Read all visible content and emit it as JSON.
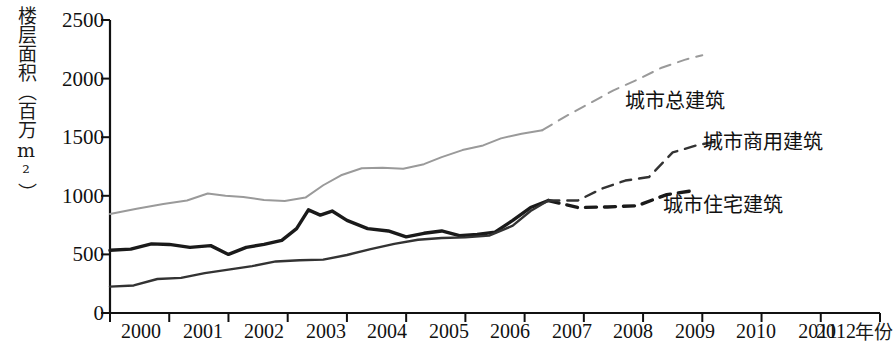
{
  "chart_data": {
    "type": "line",
    "title": "",
    "xlabel": "年份",
    "ylabel": "楼层面积（百万m²）",
    "xlim": [
      2000,
      2013
    ],
    "ylim": [
      0,
      2500
    ],
    "yticks": [
      0,
      500,
      1000,
      1500,
      2000,
      2500
    ],
    "xticks": [
      2000,
      2001,
      2002,
      2003,
      2004,
      2005,
      2006,
      2007,
      2008,
      2009,
      2010,
      2011,
      2012
    ],
    "grid": false,
    "legend_position": "inline-right",
    "series": [
      {
        "name": "城市总建筑",
        "color": "#9a9a9a",
        "width": 2.0,
        "solid_x": [
          2000.0,
          2000.45,
          2000.9,
          2001.3,
          2001.65,
          2001.95,
          2002.25,
          2002.6,
          2002.95,
          2003.3,
          2003.6,
          2003.9,
          2004.25,
          2004.6,
          2004.95,
          2005.3,
          2005.6,
          2005.95,
          2006.3,
          2006.6,
          2006.95,
          2007.3
        ],
        "solid_y": [
          845,
          890,
          930,
          960,
          1020,
          1000,
          990,
          965,
          955,
          985,
          1090,
          1175,
          1235,
          1240,
          1230,
          1270,
          1330,
          1390,
          1430,
          1490,
          1530,
          1560
        ],
        "dashed_x": [
          2007.3,
          2007.7,
          2008.1,
          2008.5,
          2008.9,
          2009.3,
          2009.7,
          2010.0
        ],
        "dashed_y": [
          1560,
          1680,
          1790,
          1900,
          1990,
          2090,
          2160,
          2200
        ]
      },
      {
        "name": "城市住宅建筑",
        "color": "#1a1a1a",
        "width": 3.4,
        "solid_x": [
          2000.0,
          2000.35,
          2000.7,
          2001.0,
          2001.35,
          2001.7,
          2002.0,
          2002.3,
          2002.6,
          2002.9,
          2003.15,
          2003.35,
          2003.55,
          2003.75,
          2004.0,
          2004.35,
          2004.7,
          2005.0,
          2005.3,
          2005.6,
          2005.9,
          2006.2,
          2006.5,
          2006.8,
          2007.1,
          2007.4
        ],
        "solid_y": [
          535,
          545,
          590,
          585,
          560,
          575,
          500,
          560,
          585,
          620,
          720,
          880,
          835,
          870,
          790,
          720,
          700,
          650,
          680,
          700,
          660,
          670,
          690,
          790,
          900,
          960
        ],
        "dashed_x": [
          2007.4,
          2007.9,
          2008.4,
          2008.9,
          2009.4,
          2009.8
        ],
        "dashed_y": [
          960,
          900,
          905,
          915,
          1010,
          1040
        ]
      },
      {
        "name": "城市商用建筑",
        "color": "#333333",
        "width": 2.4,
        "solid_x": [
          2000.0,
          2000.4,
          2000.8,
          2001.2,
          2001.6,
          2002.0,
          2002.4,
          2002.8,
          2003.2,
          2003.6,
          2004.0,
          2004.4,
          2004.8,
          2005.2,
          2005.6,
          2006.0,
          2006.4,
          2006.8,
          2007.1,
          2007.4
        ],
        "solid_y": [
          225,
          235,
          290,
          300,
          340,
          370,
          400,
          440,
          450,
          455,
          495,
          545,
          590,
          625,
          640,
          645,
          660,
          745,
          870,
          960
        ],
        "dashed_x": [
          2007.4,
          2007.9,
          2008.3,
          2008.7,
          2009.1,
          2009.5,
          2009.9,
          2010.3
        ],
        "dashed_y": [
          960,
          960,
          1060,
          1130,
          1160,
          1370,
          1430,
          1470
        ]
      }
    ],
    "annotations": [
      {
        "text": "城市总建筑",
        "x": 2010.2,
        "y": 1950
      },
      {
        "text": "城市商用建筑",
        "x": 2011.1,
        "y": 1500
      },
      {
        "text": "城市住宅建筑",
        "x": 2010.8,
        "y": 1010
      }
    ]
  },
  "axis": {
    "ylabel_text": "楼层面积（百万m²）",
    "xlabel_text": "年份",
    "ytick_labels": [
      "2500",
      "2000",
      "1500",
      "1000",
      "500",
      "0"
    ],
    "xtick_labels": [
      "2000",
      "2001",
      "2002",
      "2003",
      "2004",
      "2005",
      "2006",
      "2007",
      "2008",
      "2009",
      "2010",
      "2011",
      "2012"
    ]
  },
  "labels": {
    "total": "城市总建筑",
    "commercial": "城市商用建筑",
    "residential": "城市住宅建筑"
  },
  "colors": {
    "total_line": "#9a9a9a",
    "residential_line": "#1a1a1a",
    "commercial_line": "#333333",
    "axis": "#111111",
    "background": "#ffffff"
  }
}
